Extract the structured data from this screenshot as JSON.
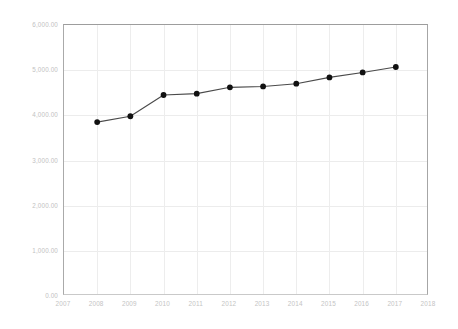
{
  "chart_data": {
    "type": "line",
    "title": "",
    "subtitle": "",
    "xlabel": "",
    "ylabel": "",
    "x": [
      2008,
      2009,
      2010,
      2011,
      2012,
      2013,
      2014,
      2015,
      2016,
      2017
    ],
    "values": [
      3850.0,
      3980.0,
      4450.0,
      4480.0,
      4620.0,
      4640.0,
      4700.0,
      4840.0,
      4950.0,
      5070.0
    ],
    "series": [
      {
        "name": "",
        "values": [
          3850.0,
          3980.0,
          4450.0,
          4480.0,
          4620.0,
          4640.0,
          4700.0,
          4840.0,
          4950.0,
          5070.0
        ]
      }
    ],
    "xlim": [
      2007,
      2018
    ],
    "ylim": [
      0,
      6000
    ],
    "x_tick_labels": [
      "2007",
      "2008",
      "2009",
      "2010",
      "2011",
      "2012",
      "2013",
      "2014",
      "2015",
      "2016",
      "2017",
      "2018"
    ],
    "x_ticks": [
      2007,
      2008,
      2009,
      2010,
      2011,
      2012,
      2013,
      2014,
      2015,
      2016,
      2017,
      2018
    ],
    "y_tick_labels": [
      "0.00",
      "1,000.00",
      "2,000.00",
      "3,000.00",
      "4,000.00",
      "5,000.00",
      "6,000.00"
    ],
    "y_ticks": [
      0,
      1000,
      2000,
      3000,
      4000,
      5000,
      6000
    ],
    "grid": true,
    "grid_axes": "both",
    "legend": false,
    "legend_position": "none",
    "marker": "circle",
    "annotations": []
  },
  "style": {
    "line_color": "#4a4a4a",
    "marker_color": "#111111",
    "grid_color": "#ececec",
    "axis_color": "#aaaaaa",
    "tick_label_color": "#c2c2c2",
    "background": "#ffffff"
  }
}
